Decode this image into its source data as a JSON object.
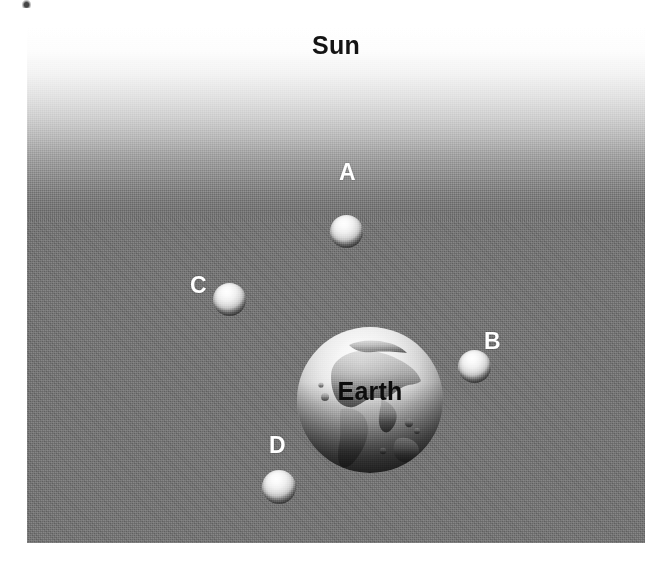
{
  "figure": {
    "background_color": "#737373",
    "frame": {
      "left": 27,
      "top": 27,
      "width": 618,
      "height": 516
    }
  },
  "sun": {
    "label": "Sun",
    "label_color": "#141414",
    "glow_color": "#ffffff",
    "direction": "top"
  },
  "earth": {
    "label": "Earth",
    "label_color": "#0d0d0d",
    "diameter_px": 146,
    "center": {
      "x": 343,
      "y": 373
    },
    "lit_side": "top"
  },
  "moons": [
    {
      "label": "A",
      "label_color": "#ffffff",
      "diameter_px": 33,
      "center": {
        "x": 346,
        "y": 231
      },
      "label_position": {
        "x": 339,
        "y": 176
      },
      "position_relative_to_earth": "above (between Earth and Sun)",
      "lit_side": "top"
    },
    {
      "label": "B",
      "label_color": "#ffffff",
      "diameter_px": 33,
      "center": {
        "x": 474,
        "y": 366
      },
      "label_position": {
        "x": 484,
        "y": 330
      },
      "position_relative_to_earth": "right",
      "lit_side": "top"
    },
    {
      "label": "C",
      "label_color": "#ffffff",
      "diameter_px": 33,
      "center": {
        "x": 229,
        "y": 299
      },
      "label_position": {
        "x": 190,
        "y": 274
      },
      "position_relative_to_earth": "upper left",
      "lit_side": "top"
    },
    {
      "label": "D",
      "label_color": "#ffffff",
      "diameter_px": 34,
      "center": {
        "x": 279,
        "y": 487
      },
      "label_position": {
        "x": 269,
        "y": 434
      },
      "position_relative_to_earth": "below (far side from Sun)",
      "lit_side": "top"
    }
  ],
  "artifact": {
    "name": "scan-speck",
    "visible": true
  }
}
